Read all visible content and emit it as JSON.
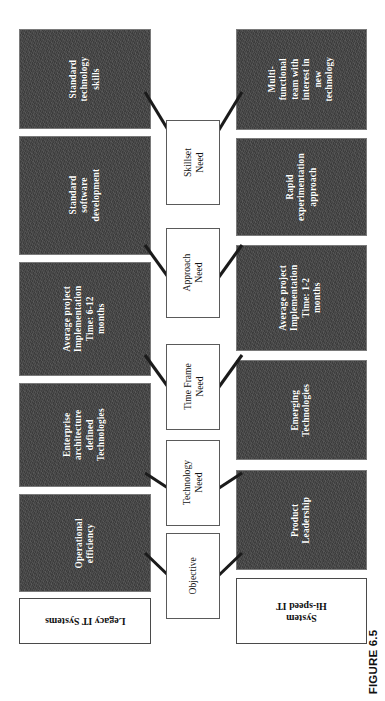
{
  "figure": {
    "caption": "FIGURE 6.5",
    "orientation": "rotated-90-ccw"
  },
  "colors": {
    "dark_box_fill": "#434343",
    "dark_box_border": "#7a7a7a",
    "dark_box_text": "#ffffff",
    "white_box_fill": "#ffffff",
    "white_box_border": "#5a5a5a",
    "connector_line": "#1b1b1b",
    "page_background": "#ffffff"
  },
  "categories": {
    "legacy": {
      "label": "Legacy IT Systems"
    },
    "hispeed": {
      "label": "Hi-speed IT\nSystem",
      "line1": "Hi-speed IT",
      "line2": "System"
    }
  },
  "criteria": [
    {
      "id": "objective",
      "label": "Objective"
    },
    {
      "id": "technology",
      "label": "Technology\nNeed",
      "line1": "Technology",
      "line2": "Need"
    },
    {
      "id": "timeframe",
      "label": "Time Frame\nNeed",
      "line1": "Time Frame",
      "line2": "Need"
    },
    {
      "id": "approach",
      "label": "Approach\nNeed",
      "line1": "Approach",
      "line2": "Need"
    },
    {
      "id": "skillset",
      "label": "Skillset\nNeed",
      "line1": "Skillset",
      "line2": "Need"
    }
  ],
  "legacy_items": [
    {
      "id": "legacy-objective",
      "lines": [
        "Operational",
        "efficiency"
      ]
    },
    {
      "id": "legacy-technology",
      "lines": [
        "Enterprise",
        "architecture",
        "defined",
        "Technologies"
      ]
    },
    {
      "id": "legacy-timeframe",
      "lines": [
        "Average project",
        "Implementation",
        "Time: 6-12",
        "months"
      ]
    },
    {
      "id": "legacy-approach",
      "lines": [
        "Standard",
        "software",
        "development"
      ]
    },
    {
      "id": "legacy-skillset",
      "lines": [
        "Standard",
        "technology",
        "skills"
      ]
    }
  ],
  "hispeed_items": [
    {
      "id": "hispeed-objective",
      "lines": [
        "Product",
        "Leadership"
      ]
    },
    {
      "id": "hispeed-technology",
      "lines": [
        "Emerging",
        "Technologies"
      ]
    },
    {
      "id": "hispeed-timeframe",
      "lines": [
        "Average project",
        "Implementation",
        "Time: 1-2",
        "months"
      ]
    },
    {
      "id": "hispeed-approach",
      "lines": [
        "Rapid",
        "experimentation",
        "approach"
      ]
    },
    {
      "id": "hispeed-skillset",
      "lines": [
        "Multi-",
        "functional",
        "team with",
        "interest in",
        "new",
        "technology"
      ]
    }
  ]
}
